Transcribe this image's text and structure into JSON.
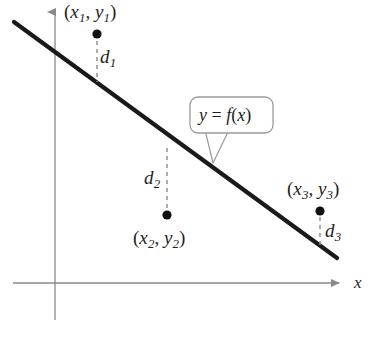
{
  "figure": {
    "kind": "least-squares-regression-diagram",
    "background_color": "#ffffff",
    "ink_color": "#231f20",
    "axis_color": "#8a8a8a",
    "callout_border_color": "#9a9a9a",
    "dash_color": "#8a8a8a"
  },
  "axes": {
    "x_axis_label": "x",
    "x_axis": {
      "x1": 13,
      "y1": 283,
      "x2": 345,
      "y2": 283,
      "arrow": "right"
    },
    "y_axis": {
      "x1": 55,
      "y1": 6,
      "x2": 55,
      "y2": 320,
      "arrow": "up"
    }
  },
  "regression_line": {
    "label": "y = f(x)",
    "label_parts": {
      "y": "y",
      "equals": "=",
      "f": "f",
      "open": "(",
      "x": "x",
      "close": ")"
    },
    "x1": 14,
    "y1": 22,
    "x2": 337,
    "y2": 258,
    "stroke_width": 4.2,
    "color": "#1a1a1a"
  },
  "callout": {
    "text": "y = f(x)",
    "box": {
      "x": 190,
      "y": 97,
      "width": 83,
      "height": 36,
      "radius": 8
    },
    "pointer_tip": {
      "x": 213,
      "y": 163
    },
    "pointer_base_left": {
      "x": 205,
      "y": 133
    },
    "pointer_base_right": {
      "x": 229,
      "y": 133
    }
  },
  "points": [
    {
      "id": "p1",
      "label": "(x1, y1)",
      "label_parts": {
        "open": "(",
        "x": "x",
        "xsub": "1",
        "comma": ",",
        "y": "y",
        "ysub": "1",
        "close": ")"
      },
      "dot": {
        "cx": 97,
        "cy": 34,
        "r": 4.6
      },
      "label_pos": {
        "left": 64,
        "top": 2
      },
      "distance": {
        "name": "d1",
        "name_parts": {
          "d": "d",
          "sub": "1"
        },
        "label_pos": {
          "left": 100,
          "top": 47
        },
        "segment": {
          "x": 97,
          "y_top": 41,
          "y_bottom": 82
        },
        "side": "below-point"
      }
    },
    {
      "id": "p2",
      "label": "(x2, y2)",
      "label_parts": {
        "open": "(",
        "x": "x",
        "xsub": "2",
        "comma": ",",
        "y": "y",
        "ysub": "2",
        "close": ")"
      },
      "dot": {
        "cx": 167,
        "cy": 215,
        "r": 4.6
      },
      "label_pos": {
        "left": 133,
        "top": 228
      },
      "distance": {
        "name": "d2",
        "name_parts": {
          "d": "d",
          "sub": "2"
        },
        "label_pos": {
          "left": 144,
          "top": 168
        },
        "segment": {
          "x": 167,
          "y_top": 148,
          "y_bottom": 209
        },
        "side": "above-point"
      }
    },
    {
      "id": "p3",
      "label": "(x3, y3)",
      "label_parts": {
        "open": "(",
        "x": "x",
        "xsub": "3",
        "comma": ",",
        "y": "y",
        "ysub": "3",
        "close": ")"
      },
      "dot": {
        "cx": 320,
        "cy": 211,
        "r": 4.6
      },
      "label_pos": {
        "left": 287,
        "top": 179
      },
      "distance": {
        "name": "d3",
        "name_parts": {
          "d": "d",
          "sub": "3"
        },
        "label_pos": {
          "left": 325,
          "top": 221
        },
        "segment": {
          "x": 320,
          "y_top": 217,
          "y_bottom": 246
        },
        "side": "below-point"
      }
    }
  ],
  "chart_data": {
    "type": "scatter",
    "title": "",
    "xlabel": "x",
    "ylabel": "",
    "grid": false,
    "legend": null,
    "annotations": [
      "y = f(x)",
      "d1",
      "d2",
      "d3",
      "(x1, y1)",
      "(x2, y2)",
      "(x3, y3)"
    ],
    "line_series": {
      "name": "y = f(x)",
      "pixel_endpoints": [
        [
          14,
          22
        ],
        [
          337,
          258
        ]
      ]
    },
    "points_pixels": [
      [
        97,
        34
      ],
      [
        167,
        215
      ],
      [
        320,
        211
      ]
    ],
    "residual_segments_pixels": [
      {
        "name": "d1",
        "x": 97,
        "from_y": 41,
        "to_y": 82
      },
      {
        "name": "d2",
        "x": 167,
        "from_y": 148,
        "to_y": 209
      },
      {
        "name": "d3",
        "x": 320,
        "from_y": 217,
        "to_y": 246
      }
    ]
  }
}
